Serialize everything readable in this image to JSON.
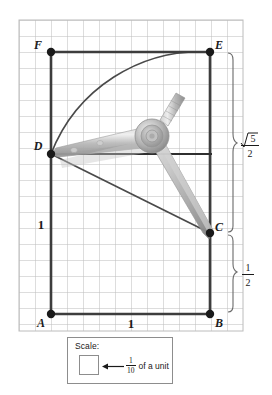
{
  "figure": {
    "kind": "geometry-construction-grid",
    "background": "#ffffff",
    "grid": {
      "x": 19,
      "y": 20,
      "width": 224,
      "height": 311,
      "cell": 16,
      "line_color": "#b9b9b9",
      "border_color": "#b9b9b9",
      "cols": 14,
      "rows": 19
    },
    "points": [
      {
        "id": "A",
        "label": "A",
        "x": 51,
        "y": 314,
        "label_x": 41,
        "label_y": 327
      },
      {
        "id": "B",
        "label": "B",
        "x": 210,
        "y": 314,
        "label_x": 216,
        "label_y": 327
      },
      {
        "id": "C",
        "label": "C",
        "x": 210,
        "y": 233,
        "label_x": 216,
        "label_y": 231
      },
      {
        "id": "D",
        "label": "D",
        "x": 51,
        "y": 154,
        "label_x": 36,
        "label_y": 150
      },
      {
        "id": "E",
        "label": "E",
        "x": 210,
        "y": 52,
        "label_x": 216,
        "label_y": 49
      },
      {
        "id": "F",
        "label": "F",
        "x": 51,
        "y": 52,
        "label_x": 37,
        "label_y": 49
      }
    ],
    "segments": [
      {
        "name": "side-AB",
        "from": "A",
        "to": "B"
      },
      {
        "name": "side-AF",
        "from": "A",
        "to": "F"
      },
      {
        "name": "side-FE",
        "from": "F",
        "to": "E"
      },
      {
        "name": "side-EB",
        "from": "E",
        "to": "B"
      },
      {
        "name": "segment-DC",
        "from": "D",
        "to": "C"
      },
      {
        "name": "segment-D-right",
        "from": "D",
        "to": "C-horizontal"
      }
    ],
    "arc": {
      "name": "arc-D-to-E",
      "center": "A",
      "from_point": "D",
      "to_point": "E",
      "radius": 160
    },
    "labels": {
      "left_side_length": "1",
      "left_side_length_x": 41,
      "left_side_length_y": 228,
      "bottom_side_length": "1",
      "bottom_side_length_x": 131,
      "bottom_side_length_y": 327
    },
    "braces": [
      {
        "name": "brace-sqrt5-over-2",
        "top_y": 52,
        "bottom_y": 233,
        "x": 232,
        "numerator": "5",
        "denominator": "2",
        "has_radical": true,
        "label_x": 247,
        "label_y": 143
      },
      {
        "name": "brace-one-half",
        "top_y": 233,
        "bottom_y": 314,
        "x": 232,
        "numerator": "1",
        "denominator": "2",
        "has_radical": false,
        "label_x": 247,
        "label_y": 273
      }
    ],
    "compass": {
      "name": "compass-tool",
      "pivot_x": 152,
      "pivot_y": 136,
      "point_leg_tip_x": 51,
      "point_leg_tip_y": 154,
      "pencil_leg_tip_x": 211,
      "pencil_leg_tip_y": 236,
      "handle_tip_x": 178,
      "handle_tip_y": 92,
      "body_color": "#b9b9b9",
      "shade_color": "#8f8f8f",
      "highlight_color": "#dedede"
    },
    "colors": {
      "stroke_dark": "#3d3d3d",
      "stroke_point": "#1a1a1a",
      "grid": "#b9b9b9",
      "text": "#1a1a1a"
    }
  },
  "scale_legend": {
    "title": "Scale:",
    "arrow_icon": "left-arrow-icon",
    "swatch_icon": "unit-square-icon",
    "fraction_numerator": "1",
    "fraction_denominator": "10",
    "text_after": "of a unit"
  }
}
